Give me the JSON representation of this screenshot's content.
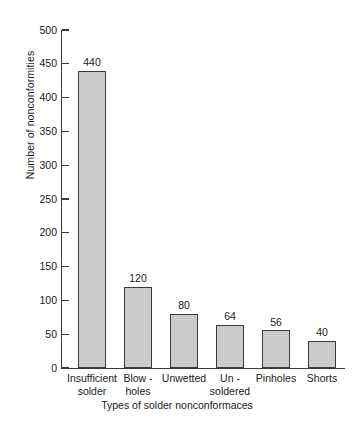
{
  "chart_data": {
    "type": "bar",
    "title": "",
    "xlabel": "Types of solder nonconformaces",
    "ylabel": "Number of nonconformities",
    "categories": [
      "Insufficient solder",
      "Blow - holes",
      "Unwetted",
      "Un - soldered",
      "Pinholes",
      "Shorts"
    ],
    "category_lines": [
      [
        "Insufficient",
        "solder"
      ],
      [
        "Blow -",
        "holes"
      ],
      [
        "Unwetted",
        ""
      ],
      [
        "Un -",
        "soldered"
      ],
      [
        "Pinholes",
        ""
      ],
      [
        "Shorts",
        ""
      ]
    ],
    "values": [
      440,
      120,
      80,
      64,
      56,
      40
    ],
    "value_labels": [
      "440",
      "120",
      "80",
      "64",
      "56",
      "40"
    ],
    "ylim": [
      0,
      500
    ],
    "ytick_step": 50,
    "yticks": [
      0,
      50,
      100,
      150,
      200,
      250,
      300,
      350,
      400,
      450,
      500
    ],
    "ytick_labels": [
      "0",
      "50",
      "100",
      "150",
      "200",
      "250",
      "300",
      "350",
      "400",
      "450",
      "500"
    ],
    "grid": false,
    "legend": false,
    "legend_position": "none",
    "bar_fill_color": "#cbcbcb",
    "bar_edge_color": "#3c3c3c",
    "axis_color": "#3a3a3a",
    "background_color": "#ffffff"
  }
}
